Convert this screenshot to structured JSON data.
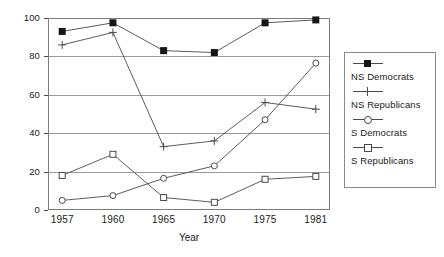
{
  "chart_data": {
    "type": "line",
    "title": "",
    "xlabel": "Year",
    "ylabel": "(in percent)",
    "categories": [
      "1957",
      "1960",
      "1965",
      "1970",
      "1975",
      "1981"
    ],
    "xlim": [
      0,
      5
    ],
    "ylim": [
      0,
      100
    ],
    "yticks": [
      0,
      20,
      40,
      60,
      80,
      100
    ],
    "grid": "horizontal",
    "legend_position": "right-outside",
    "series": [
      {
        "name": "NS Democrats",
        "marker": "filled-square",
        "values": [
          93,
          97.5,
          83,
          82,
          97.5,
          99
        ]
      },
      {
        "name": "NS Republicans",
        "marker": "plus",
        "values": [
          86,
          92.5,
          33,
          36,
          56,
          52.5
        ]
      },
      {
        "name": "S Democrats",
        "marker": "open-circle",
        "values": [
          5,
          7.5,
          16.5,
          23,
          47,
          76.5
        ]
      },
      {
        "name": "S Republicans",
        "marker": "open-square",
        "values": [
          18,
          29,
          6.5,
          4,
          16,
          17.5
        ]
      }
    ]
  },
  "axis": {
    "ytick_labels": [
      "0",
      "20",
      "40",
      "60",
      "80",
      "100"
    ],
    "xtick_labels": [
      "1957",
      "1960",
      "1965",
      "1970",
      "1975",
      "1981"
    ],
    "ylabel_text": "(in percent)",
    "xlabel_text": "Year"
  },
  "legend": {
    "entries": [
      {
        "label": "NS Democrats",
        "marker": "filled-square"
      },
      {
        "label": "NS Republicans",
        "marker": "plus"
      },
      {
        "label": "S Democrats",
        "marker": "open-circle"
      },
      {
        "label": "S Republicans",
        "marker": "open-square"
      }
    ]
  },
  "colors": {
    "line": "#4a4a4a",
    "marker_fill": "#151515",
    "grid": "#9a9a9a",
    "frame": "#7d7d7d",
    "background": "#ffffff",
    "text": "#1a1a1a"
  }
}
